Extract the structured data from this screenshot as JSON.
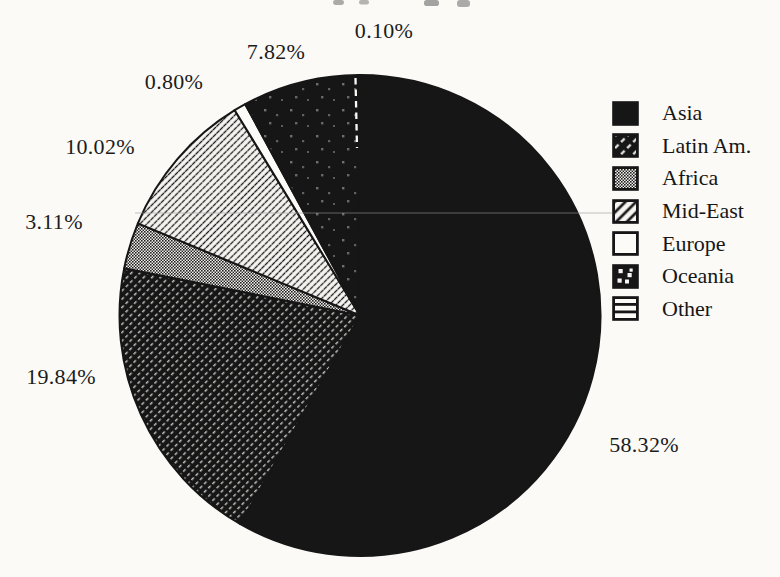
{
  "page": {
    "background_color": "#fbfaf7",
    "ink_color": "#161616",
    "note": "scanned monochrome pie chart, title cropped off at top edge"
  },
  "chart_data": {
    "type": "pie",
    "title": "",
    "direction": "clockwise",
    "start_angle": "12 o'clock",
    "legend_position": "right",
    "grid": "off",
    "slices": [
      {
        "label": "Asia",
        "value": 58.32,
        "display": "58.32%",
        "pattern": "solid-black"
      },
      {
        "label": "Latin Am.",
        "value": 19.84,
        "display": "19.84%",
        "pattern": "white-dashed-diagonal-on-black"
      },
      {
        "label": "Africa",
        "value": 3.11,
        "display": "3.11%",
        "pattern": "gray-dither"
      },
      {
        "label": "Mid-East",
        "value": 10.02,
        "display": "10.02%",
        "pattern": "black-diagonal-stripes-on-white"
      },
      {
        "label": "Europe",
        "value": 0.8,
        "display": "0.80%",
        "pattern": "plain-white"
      },
      {
        "label": "Oceania",
        "value": 7.82,
        "display": "7.82%",
        "pattern": "white-dots-on-black"
      },
      {
        "label": "Other",
        "value": 0.1,
        "display": "0.10%",
        "pattern": "horizontal-lines-on-white"
      }
    ]
  }
}
